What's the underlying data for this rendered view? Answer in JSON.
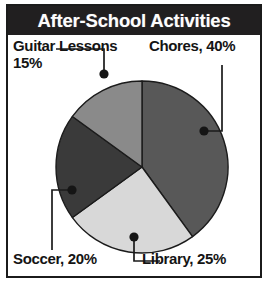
{
  "header": {
    "title": "After-School Activities"
  },
  "labels": {
    "guitar_line1": "Guitar Lessons",
    "guitar_line2": "15%",
    "chores": "Chores, 40%",
    "soccer": "Soccer, 20%",
    "library": "Library, 25%"
  },
  "colors": {
    "frame": "#1b1b1b",
    "titlebar_bg": "#211f20",
    "title_text": "#fdfdfd",
    "label_text": "#141414",
    "leader_line": "#1b1b1b",
    "slice_chores": "#585858",
    "slice_library": "#d8d8d8",
    "slice_soccer": "#3a3a3a",
    "slice_guitar": "#8a8a8a",
    "slice_outline": "#1b1b1b"
  },
  "chart_data": {
    "type": "pie",
    "title": "After-School Activities",
    "xlabel": "",
    "ylabel": "",
    "grid": false,
    "legend": "none (direct labels with leader lines)",
    "start_angle_deg": 0,
    "direction": "clockwise",
    "labels": [
      "Chores",
      "Library",
      "Soccer",
      "Guitar Lessons"
    ],
    "values": [
      40,
      25,
      20,
      15
    ],
    "units": "percent",
    "total": 100,
    "slices": [
      {
        "name": "Chores",
        "value": 40,
        "display": "Chores, 40%",
        "color": "#585858",
        "start_deg": 0,
        "end_deg": 144
      },
      {
        "name": "Library",
        "value": 25,
        "display": "Library, 25%",
        "color": "#d8d8d8",
        "start_deg": 144,
        "end_deg": 234
      },
      {
        "name": "Soccer",
        "value": 20,
        "display": "Soccer, 20%",
        "color": "#3a3a3a",
        "start_deg": 234,
        "end_deg": 306
      },
      {
        "name": "Guitar Lessons",
        "value": 15,
        "display": "Guitar Lessons 15%",
        "color": "#8a8a8a",
        "start_deg": 306,
        "end_deg": 360
      }
    ]
  }
}
